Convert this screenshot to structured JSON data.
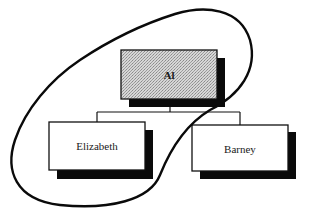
{
  "diagram": {
    "type": "org-chart",
    "nodes": [
      {
        "id": "al",
        "label": "Al",
        "role": "parent",
        "fill": "stippled-gray"
      },
      {
        "id": "elizabeth",
        "label": "Elizabeth",
        "role": "child",
        "fill": "#ffffff"
      },
      {
        "id": "barney",
        "label": "Barney",
        "role": "child",
        "fill": "#ffffff"
      }
    ],
    "edges": [
      {
        "from": "al",
        "to": "elizabeth"
      },
      {
        "from": "al",
        "to": "barney"
      }
    ],
    "grouping": {
      "shape": "freehand-loop",
      "encloses": [
        "al",
        "elizabeth"
      ]
    },
    "colors": {
      "stroke": "#111111",
      "shadow": "#0a0a0a",
      "parent_fill": "#c8c8c8",
      "child_fill": "#ffffff",
      "background": "#ffffff"
    }
  }
}
